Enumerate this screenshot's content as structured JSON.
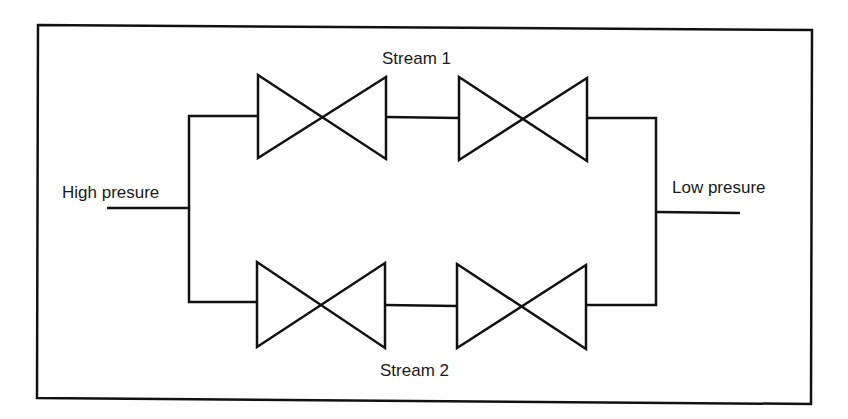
{
  "diagram": {
    "labels": {
      "high_pressure": "High presure",
      "low_pressure": "Low presure",
      "stream1": "Stream 1",
      "stream2": "Stream 2"
    },
    "streams": [
      {
        "name": "Stream 1",
        "valves": 2
      },
      {
        "name": "Stream 2",
        "valves": 2
      }
    ],
    "colors": {
      "stroke": "#111111",
      "background": "#ffffff"
    }
  }
}
